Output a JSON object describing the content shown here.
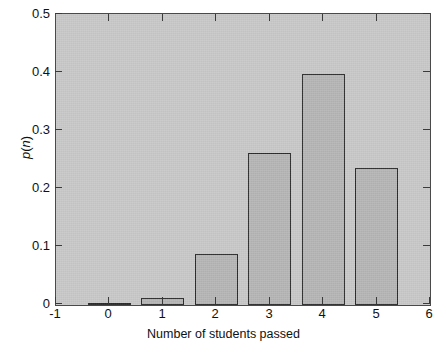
{
  "chart_data": {
    "type": "bar",
    "title": "",
    "subtitle": "",
    "xlabel": "Number of students passed",
    "ylabel": "p(n)",
    "categories": [
      "0",
      "1",
      "2",
      "3",
      "4",
      "5"
    ],
    "x": [
      0,
      1,
      2,
      3,
      4,
      5
    ],
    "values": [
      0.003,
      0.012,
      0.088,
      0.262,
      0.397,
      0.235
    ],
    "xlim": [
      -1,
      6
    ],
    "ylim": [
      0,
      0.5
    ],
    "xticks": [
      "-1",
      "0",
      "1",
      "2",
      "3",
      "4",
      "5",
      "6"
    ],
    "xtick_values": [
      -1,
      0,
      1,
      2,
      3,
      4,
      5,
      6
    ],
    "yticks": [
      "0",
      "0.1",
      "0.2",
      "0.3",
      "0.4",
      "0.5"
    ],
    "ytick_values": [
      0,
      0.1,
      0.2,
      0.3,
      0.4,
      0.5
    ],
    "bar_width": 0.8,
    "grid": false,
    "legend": null,
    "annotations": [],
    "colors": {
      "bar_fill": "#b6b6b6",
      "bar_edge": "#2b2b2b",
      "plot_background": "#c9c9c9",
      "axis": "#4a4a4a",
      "figure_background": "#ffffff",
      "text": "#111111"
    }
  },
  "axes": {
    "x_title": "Number of students passed",
    "y_title": "p(n)",
    "y_title_parts": {
      "fn": "p",
      "open": "(",
      "arg": "n",
      "close": ")"
    }
  },
  "ytick_labels": [
    "0.5",
    "0.4",
    "0.3",
    "0.2",
    "0.1",
    "0"
  ],
  "xtick_labels": [
    "-1",
    "0",
    "1",
    "2",
    "3",
    "4",
    "5",
    "6"
  ]
}
